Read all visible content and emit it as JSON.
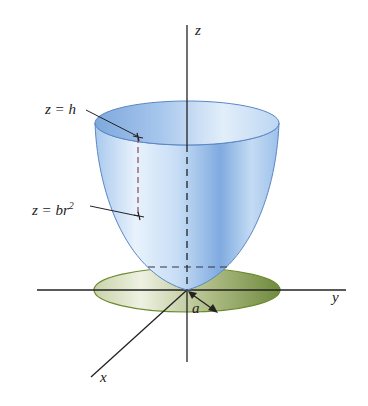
{
  "figure": {
    "axes": {
      "z_label": "z",
      "y_label": "y",
      "x_label": "x"
    },
    "labels": {
      "top_plane": "z = h",
      "surface_eq_prefix": "z = br",
      "surface_eq_exponent": "2",
      "radius": "a"
    },
    "colors": {
      "surface_light": "#e6f1fb",
      "surface_mid": "#b7d5f2",
      "surface_dark": "#6f9fd8",
      "surface_edge": "#5b86c4",
      "disk_light": "#eef1e2",
      "disk_dark": "#6f8a3e",
      "disk_edge": "#6b8a2e",
      "axis": "#222222",
      "dashed_red": "#8c4a55"
    }
  }
}
